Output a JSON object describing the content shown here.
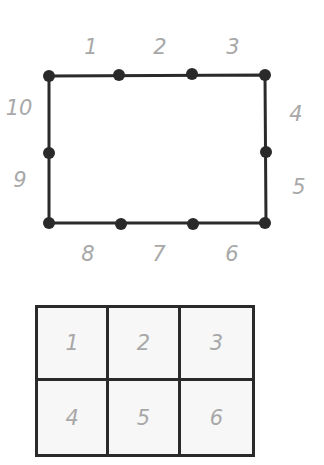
{
  "diagram_top": {
    "shape": "rectangle",
    "points": [
      {
        "label": "1",
        "x": 91,
        "y": 47
      },
      {
        "label": "2",
        "x": 160,
        "y": 47
      },
      {
        "label": "3",
        "x": 233,
        "y": 47
      },
      {
        "label": "4",
        "x": 296,
        "y": 114
      },
      {
        "label": "5",
        "x": 299,
        "y": 187
      },
      {
        "label": "6",
        "x": 232,
        "y": 254
      },
      {
        "label": "7",
        "x": 159,
        "y": 254
      },
      {
        "label": "8",
        "x": 88,
        "y": 254
      },
      {
        "label": "9",
        "x": 20,
        "y": 180
      },
      {
        "label": "10",
        "x": 19,
        "y": 108
      }
    ],
    "dots": [
      [
        49,
        76
      ],
      [
        119,
        75
      ],
      [
        192,
        74
      ],
      [
        265,
        75
      ],
      [
        266,
        152
      ],
      [
        265,
        223
      ],
      [
        193,
        224
      ],
      [
        121,
        224
      ],
      [
        49,
        223
      ],
      [
        49,
        153
      ]
    ]
  },
  "diagram_bottom": {
    "cells": [
      "1",
      "2",
      "3",
      "4",
      "5",
      "6"
    ]
  },
  "colors": {
    "line": "#2a2a2a",
    "label": "#a8a8a8",
    "cell_bg": "#f7f7f7"
  }
}
